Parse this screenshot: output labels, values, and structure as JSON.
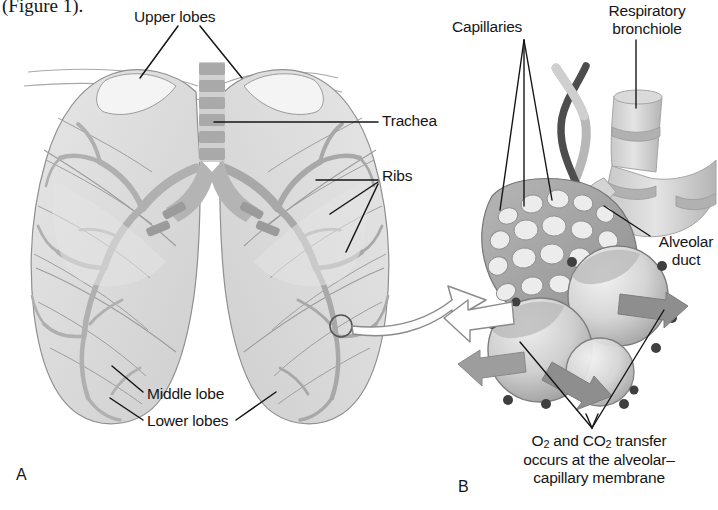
{
  "figure": {
    "domain": "anatomy-illustration",
    "title_fragment": "(Figure 1).",
    "background_color": "#ffffff",
    "ink_color": "#161616",
    "tissue_light": "#dcdcdc",
    "tissue_mid": "#b9b9b9",
    "tissue_dark": "#8d8d8d",
    "vessel_dark": "#4a4a4a",
    "arrow_gray": "#9a9a9a",
    "panels": [
      {
        "letter": "A",
        "name": "lungs-thorax-overview",
        "labels": [
          "Upper lobes",
          "Trachea",
          "Ribs",
          "Middle lobe",
          "Lower lobes"
        ]
      },
      {
        "letter": "B",
        "name": "alveolar-capillary-detail",
        "labels": [
          "Capillaries",
          "Respiratory bronchiole",
          "Alveolar duct"
        ],
        "caption_lines": [
          "O2 and CO2 transfer",
          "occurs at the alveolar–",
          "capillary membrane"
        ]
      }
    ]
  },
  "labels": {
    "figure_ref": "(Figure 1).",
    "upper_lobes": "Upper lobes",
    "trachea": "Trachea",
    "ribs": "Ribs",
    "middle_lobe": "Middle lobe",
    "lower_lobes": "Lower lobes",
    "panel_a": "A",
    "capillaries": "Capillaries",
    "respiratory_bronchiole_line1": "Respiratory",
    "respiratory_bronchiole_line2": "bronchiole",
    "alveolar_duct_line1": "Alveolar",
    "alveolar_duct_line2": "duct",
    "transfer_line1_pre": "O",
    "transfer_line1_sub1": "2",
    "transfer_line1_mid": " and CO",
    "transfer_line1_sub2": "2",
    "transfer_line1_post": " transfer",
    "transfer_line2": "occurs at the alveolar–",
    "transfer_line3": "capillary membrane",
    "panel_b": "B"
  }
}
